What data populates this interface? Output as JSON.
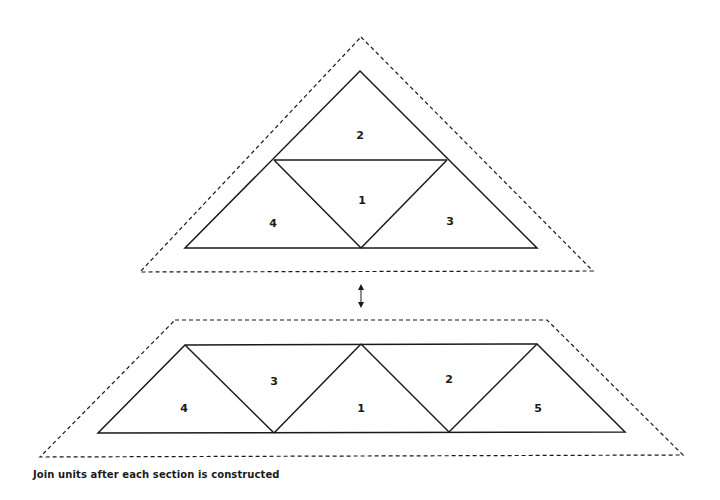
{
  "caption": "Join units after each section is constructed",
  "colors": {
    "line": "#1a1a1a",
    "background": "#ffffff"
  },
  "upper_unit": {
    "labels": {
      "top": "2",
      "center": "1",
      "left": "4",
      "right": "3"
    }
  },
  "connector": {
    "icon": "double-arrow-vertical"
  },
  "lower_unit": {
    "labels": {
      "left": "4",
      "second": "3",
      "center": "1",
      "fourth": "2",
      "right": "5"
    }
  }
}
